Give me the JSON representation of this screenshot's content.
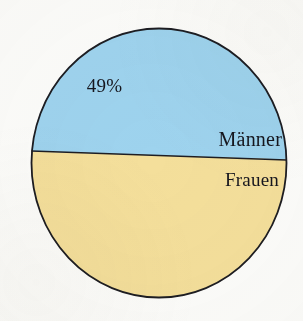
{
  "figure": {
    "background_color": "#fcfcfa",
    "outline_color": "#1d1d22",
    "label_text_color": "#16161e"
  },
  "labels": {
    "percent": "49%",
    "upper_slice": "Männer",
    "lower_slice": "Frauen"
  },
  "chart_data": {
    "type": "pie",
    "title": "",
    "subtitle": "",
    "xlabel": "",
    "ylabel": "",
    "grid": false,
    "legend": "none",
    "labels_position": "inside-slices",
    "start_angle_deg": 88,
    "direction": "clockwise",
    "categories": [
      "Männer",
      "Frauen"
    ],
    "values": [
      49,
      51
    ],
    "value_unit": "%",
    "data_labels": [
      "49%",
      ""
    ],
    "slice_colors": [
      "#9ed3ee",
      "#f4df9b"
    ],
    "slices": [
      {
        "label": "Männer",
        "value": 49,
        "display_value": "49%",
        "color": "#9ed3ee",
        "position": "upper"
      },
      {
        "label": "Frauen",
        "value": 51,
        "display_value": "",
        "color": "#f4df9b",
        "position": "lower"
      }
    ],
    "geometry": {
      "center_x": 159,
      "center_y": 163,
      "radius_x": 128,
      "radius_y": 135,
      "divider_left_y": 151,
      "divider_right_y": 160
    }
  }
}
